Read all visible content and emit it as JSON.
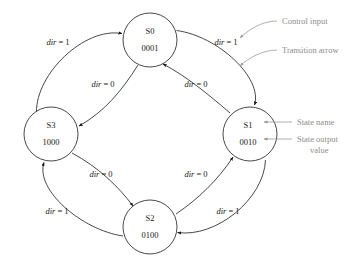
{
  "diagram": {
    "states": [
      {
        "id": "S0",
        "name": "S0",
        "output": "0001",
        "cx": 150,
        "cy": 40,
        "r": 27
      },
      {
        "id": "S1",
        "name": "S1",
        "output": "0010",
        "cx": 250,
        "cy": 134,
        "r": 27
      },
      {
        "id": "S2",
        "name": "S2",
        "output": "0100",
        "cx": 150,
        "cy": 227,
        "r": 27
      },
      {
        "id": "S3",
        "name": "S3",
        "output": "1000",
        "cx": 51,
        "cy": 134,
        "r": 27
      }
    ],
    "transitions": [
      {
        "id": "t-s0-s3",
        "from": "S0",
        "to": "S3",
        "label_var": "dir",
        "label_eq": " = 0",
        "ring": "inner",
        "lx": 103,
        "ly": 87
      },
      {
        "id": "t-s1-s0",
        "from": "S1",
        "to": "S0",
        "label_var": "dir",
        "label_eq": " = 0",
        "ring": "inner",
        "lx": 196,
        "ly": 87
      },
      {
        "id": "t-s3-s2",
        "from": "S3",
        "to": "S2",
        "label_var": "dir",
        "label_eq": " = 0",
        "ring": "inner",
        "lx": 101,
        "ly": 177
      },
      {
        "id": "t-s2-s1",
        "from": "S2",
        "to": "S1",
        "label_var": "dir",
        "label_eq": " = 0",
        "ring": "inner",
        "lx": 196,
        "ly": 177
      },
      {
        "id": "t-s3-s0",
        "from": "S3",
        "to": "S0",
        "label_var": "dir",
        "label_eq": " = 1",
        "ring": "outer",
        "lx": 58,
        "ly": 45
      },
      {
        "id": "t-s0-s1",
        "from": "S0",
        "to": "S1",
        "label_var": "dir",
        "label_eq": " = 1",
        "ring": "outer",
        "lx": 226,
        "ly": 45
      },
      {
        "id": "t-s1-s2",
        "from": "S1",
        "to": "S2",
        "label_var": "dir",
        "label_eq": " = 1",
        "ring": "outer",
        "lx": 228,
        "ly": 214
      },
      {
        "id": "t-s2-s3",
        "from": "S2",
        "to": "S3",
        "label_var": "dir",
        "label_eq": " = 1",
        "ring": "outer",
        "lx": 57,
        "ly": 214
      }
    ],
    "annotations": [
      {
        "id": "control-input",
        "text": "Control input",
        "text2": "",
        "tx": 282,
        "ty": 26
      },
      {
        "id": "transition-arrow",
        "text": "Transition arrow",
        "text2": "",
        "tx": 282,
        "ty": 53
      },
      {
        "id": "state-name",
        "text": "State name",
        "text2": "",
        "tx": 297,
        "ty": 125
      },
      {
        "id": "state-output-value",
        "text": "State output",
        "text2": "value",
        "tx": 297,
        "ty": 145
      }
    ],
    "colors": {
      "stroke": "#1a1a1a",
      "annotation": "#8d8d8d",
      "background": "#ffffff"
    }
  }
}
